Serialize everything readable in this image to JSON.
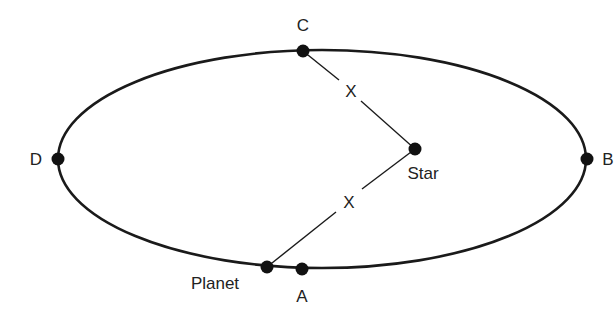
{
  "diagram": {
    "colors": {
      "line": "#1a1a1a",
      "text": "#222222",
      "background": "#ffffff"
    },
    "orbit": {
      "cx": 322,
      "cy": 159,
      "rx": 264,
      "ry": 109
    },
    "points": {
      "A": {
        "label": "A",
        "x": 302,
        "y": 269
      },
      "B": {
        "label": "B",
        "x": 587,
        "y": 159
      },
      "C": {
        "label": "C",
        "x": 303,
        "y": 51
      },
      "D": {
        "label": "D",
        "x": 58,
        "y": 159
      },
      "star": {
        "label": "Star",
        "x": 415,
        "y": 149
      },
      "planet": {
        "label": "Planet",
        "x": 267,
        "y": 267
      }
    },
    "distances": {
      "upper": "X",
      "lower": "X"
    }
  }
}
